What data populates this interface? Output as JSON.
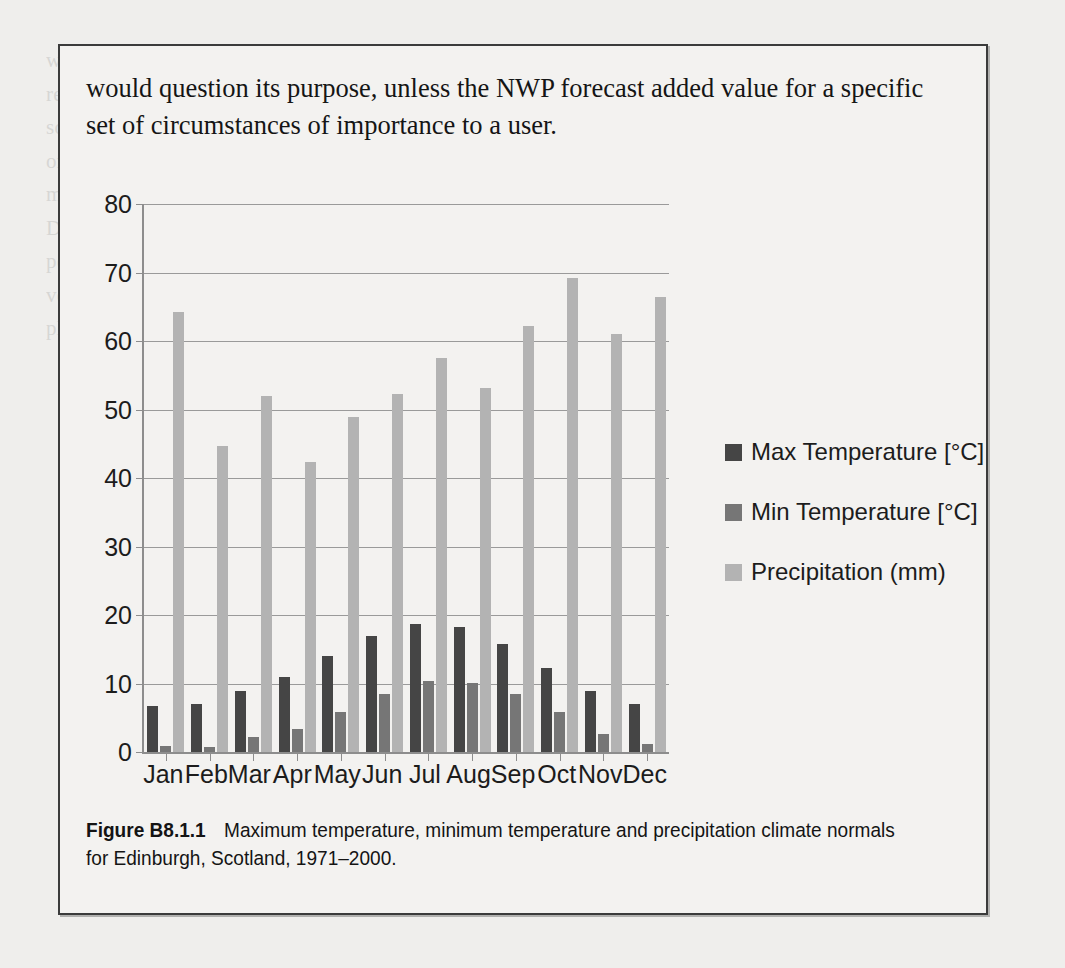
{
  "page": {
    "bleed_text": "we note the arbitrariness of which case we need to show skill at\nreduce harm in situations. Such as the exceedance of a wind speed threshold above which\nsome warning state is required. Are we trying to evaluate a deterministic\nor a probability forecast? Are we verifying all the model or another issue of\nmodelling or focusing on a single performance in a continuous daily basis?\nDo we have a range for the forecast accuracy, perhaps in the form of a\nperformance indicator? It is these verification work feed into a detailed\nverification framework, and how should a forecaster cater them used in the\nplanning will help understand weather and attributable forecast value."
  },
  "feature_box": {
    "body_text": "would question its purpose, unless the NWP forecast added value for a specific set of circumstances of importance to a user.",
    "caption_label": "Figure B8.1.1",
    "caption_text": "Maximum temperature, minimum temperature and precipitation climate normals for Edinburgh, Scotland, 1971–2000."
  },
  "chart_data": {
    "type": "bar",
    "title": "",
    "xlabel": "",
    "ylabel": "",
    "ylim": [
      0,
      80
    ],
    "yticks": [
      0,
      10,
      20,
      30,
      40,
      50,
      60,
      70,
      80
    ],
    "grid": true,
    "legend_position": "right",
    "categories": [
      "Jan",
      "Feb",
      "Mar",
      "Apr",
      "May",
      "Jun",
      "Jul",
      "Aug",
      "Sep",
      "Oct",
      "Nov",
      "Dec"
    ],
    "series": [
      {
        "name": "Max Temperature [°C]",
        "color": "#454545",
        "values": [
          6.7,
          7.0,
          8.9,
          10.9,
          14.0,
          16.9,
          18.7,
          18.3,
          15.7,
          12.3,
          8.9,
          7.0
        ]
      },
      {
        "name": "Min Temperature [°C]",
        "color": "#767676",
        "values": [
          0.9,
          0.8,
          2.2,
          3.4,
          5.9,
          8.5,
          10.3,
          10.1,
          8.4,
          5.8,
          2.6,
          1.1
        ]
      },
      {
        "name": "Precipitation (mm)",
        "color": "#b3b3b3",
        "values": [
          64.2,
          44.7,
          52.0,
          42.4,
          48.9,
          52.3,
          57.5,
          53.1,
          62.2,
          69.2,
          61.0,
          66.4
        ]
      }
    ]
  }
}
